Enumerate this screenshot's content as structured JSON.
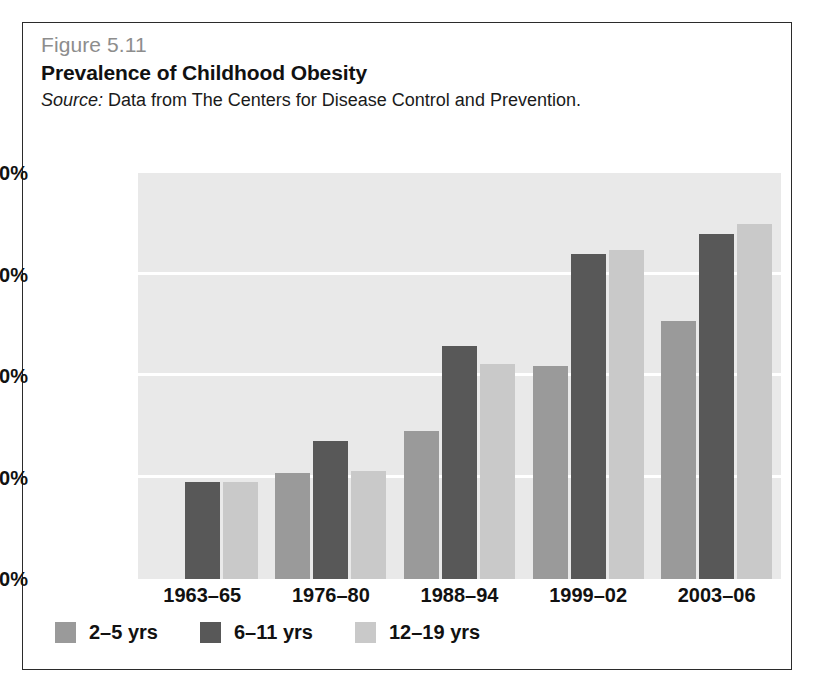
{
  "figure": {
    "number": "Figure 5.11",
    "title": "Prevalence of Childhood Obesity",
    "source_label": "Source:",
    "source_text": " Data from The Centers for Disease Control and Prevention."
  },
  "colors": {
    "series_2_5": "#9a9a9a",
    "series_6_11": "#585858",
    "series_12_19": "#c9c9c9",
    "plot_background": "#e9e9e9",
    "gridline": "#ffffff",
    "figure_number": "#8d8d8d",
    "text": "#111111",
    "border": "#2b2b2b"
  },
  "chart_data": {
    "type": "bar",
    "title": "Prevalence of Childhood Obesity",
    "subtitle": "Source: Data from The Centers for Disease Control and Prevention.",
    "xlabel": "",
    "ylabel": "",
    "ylim": [
      0,
      20
    ],
    "ytick_values": [
      0,
      5,
      10,
      15,
      20
    ],
    "ytick_labels": [
      "0.00%",
      "5.00%",
      "10.00%",
      "15.00%",
      "20.00%"
    ],
    "grid": true,
    "legend_position": "bottom-left",
    "categories": [
      "1963–65",
      "1976–80",
      "1988–94",
      "1999–02",
      "2003–06"
    ],
    "series": [
      {
        "name": "2–5 yrs",
        "values": [
          null,
          5.2,
          7.3,
          10.5,
          12.7
        ]
      },
      {
        "name": "6–11 yrs",
        "values": [
          4.8,
          6.8,
          11.5,
          16.0,
          17.0
        ]
      },
      {
        "name": "12–19 yrs",
        "values": [
          4.8,
          5.3,
          10.6,
          16.2,
          17.5
        ]
      }
    ]
  }
}
